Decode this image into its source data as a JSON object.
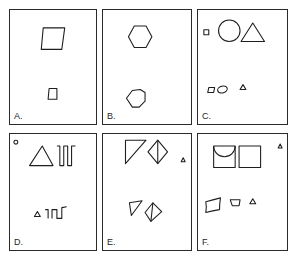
{
  "figure": {
    "panels": [
      {
        "id": "A",
        "label": "A.",
        "description": "Large parallelogram above, small square below"
      },
      {
        "id": "B",
        "label": "B.",
        "description": "Hexagon above, irregular heptagon below"
      },
      {
        "id": "C",
        "label": "C.",
        "description": "Small square, circle, triangle above; small parallelogram, ellipse, triangle below"
      },
      {
        "id": "D",
        "label": "D.",
        "description": "Small circle, triangle, square-wave above; small triangle, partial square-wave below"
      },
      {
        "id": "E",
        "label": "E.",
        "description": "Right triangle and divided diamond above with small triangle; smaller versions below"
      },
      {
        "id": "F",
        "label": "F.",
        "description": "Square with arc, square, small triangle above; distorted rectangle, trapezoid, triangle below"
      }
    ]
  }
}
